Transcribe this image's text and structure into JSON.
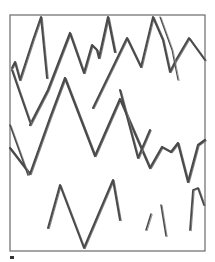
{
  "sketch": {
    "description": "Hand-drawn zigzag lines inside a rectangular frame",
    "frame": {
      "x": 10,
      "y": 15,
      "width": 195,
      "height": 236,
      "color": "#6a6a6a"
    },
    "stroke_color": "#4a4a4a",
    "strokes": [
      {
        "id": "row1-left",
        "width": 2,
        "points": "12,68 15,62 20,80 33,40 41,17 47,78"
      },
      {
        "id": "row1-mid",
        "width": 2.2,
        "points": "30,125 48,90 70,33 84,73 92,45 97,50 99,58 103,40 108,17 115,52"
      },
      {
        "id": "row1-right",
        "width": 2,
        "points": "93,108 127,38 141,67 153,17 163,40 170,72 176,60 189,38 205,60"
      },
      {
        "id": "row1-right-b",
        "width": 1.2,
        "points": "160,17 172,50 178,80"
      },
      {
        "id": "row2-left",
        "width": 2,
        "points": "12,70 30,122"
      },
      {
        "id": "row2-main",
        "width": 2.2,
        "points": "10,148 30,174 50,118 65,78 95,156 120,99 150,168 162,147 171,152 178,143 188,182 198,145 205,140"
      },
      {
        "id": "row2-under",
        "width": 1.5,
        "points": "10,125 28,175"
      },
      {
        "id": "row2-vdip",
        "width": 2,
        "points": "120,90 138,158 150,130"
      },
      {
        "id": "row3-main",
        "width": 2,
        "points": "48,228 60,185 84,248 113,180 120,220"
      },
      {
        "id": "row3-tick1",
        "width": 1.5,
        "points": "146,230 151,214"
      },
      {
        "id": "row3-tick2",
        "width": 1.5,
        "points": "161,205 166,236"
      },
      {
        "id": "row3-curve",
        "width": 1.8,
        "points": "190,230 193,190 198,188 204,205"
      }
    ],
    "footer_mark": "▪"
  }
}
